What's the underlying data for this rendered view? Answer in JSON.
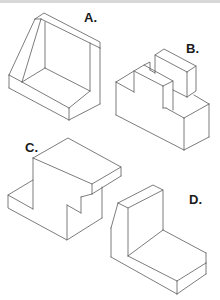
{
  "figure": {
    "shapes": [
      {
        "id": "A",
        "label": "A.",
        "description": "L-shaped bracket with slanted side gusset"
      },
      {
        "id": "B",
        "label": "B.",
        "description": "Notched block with raised rectangular top block"
      },
      {
        "id": "C",
        "label": "C.",
        "description": "Stepped block with overhanging top slab"
      },
      {
        "id": "D",
        "label": "D.",
        "description": "L-shaped block with chamfered left upright"
      }
    ]
  },
  "colors": {
    "line": "#5a5a5a",
    "label": "#1a1a1a",
    "background": "#ffffff",
    "top_strip": "#d8d8d8"
  }
}
